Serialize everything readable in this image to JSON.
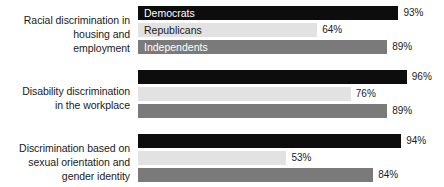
{
  "chart": {
    "type": "bar",
    "orientation": "horizontal",
    "legend_position": "inside-first-group-bars"
  },
  "legend": {
    "items": [
      {
        "label": "Democrats",
        "color": "#0d0d0d"
      },
      {
        "label": "Republicans",
        "color": "#e2e2e2"
      },
      {
        "label": "Independents",
        "color": "#7a7a7a"
      }
    ]
  },
  "chart_data": {
    "type": "bar",
    "title": "",
    "subtitle": "",
    "xlabel": "",
    "ylabel": "",
    "xlim": [
      0,
      100
    ],
    "grid": false,
    "legend_position": "inside-first-group-bars",
    "value_suffix": "%",
    "categories": [
      "Racial discrimination in housing and employment",
      "Disability discrimination in the workplace",
      "Discrimination based on sexual orientation and gender identity"
    ],
    "series": [
      {
        "name": "Democrats",
        "color": "#0d0d0d",
        "values": [
          93,
          96,
          94
        ]
      },
      {
        "name": "Republicans",
        "color": "#e2e2e2",
        "values": [
          64,
          76,
          53
        ]
      },
      {
        "name": "Independents",
        "color": "#7a7a7a",
        "values": [
          89,
          89,
          84
        ]
      }
    ]
  },
  "groups": [
    {
      "label_lines": [
        "Racial discrimination in",
        "housing and",
        "employment"
      ],
      "bars": [
        {
          "series": "Democrats",
          "value": 93,
          "value_label": "93%",
          "legend_label": "Democrats"
        },
        {
          "series": "Republicans",
          "value": 64,
          "value_label": "64%",
          "legend_label": "Republicans"
        },
        {
          "series": "Independents",
          "value": 89,
          "value_label": "89%",
          "legend_label": "Independents"
        }
      ]
    },
    {
      "label_lines": [
        "Disability discrimination",
        "in the workplace"
      ],
      "bars": [
        {
          "series": "Democrats",
          "value": 96,
          "value_label": "96%",
          "legend_label": ""
        },
        {
          "series": "Republicans",
          "value": 76,
          "value_label": "76%",
          "legend_label": ""
        },
        {
          "series": "Independents",
          "value": 89,
          "value_label": "89%",
          "legend_label": ""
        }
      ]
    },
    {
      "label_lines": [
        "Discrimination based on",
        "sexual orientation and",
        "gender identity"
      ],
      "bars": [
        {
          "series": "Democrats",
          "value": 94,
          "value_label": "94%",
          "legend_label": ""
        },
        {
          "series": "Republicans",
          "value": 53,
          "value_label": "53%",
          "legend_label": ""
        },
        {
          "series": "Independents",
          "value": 84,
          "value_label": "84%",
          "legend_label": ""
        }
      ]
    }
  ]
}
